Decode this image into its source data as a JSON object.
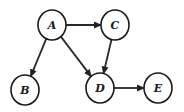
{
  "diagram": {
    "type": "directed-graph",
    "nodes": [
      {
        "id": "A",
        "label": "A",
        "cx": 52,
        "cy": 25,
        "rx": 14,
        "ry": 15
      },
      {
        "id": "C",
        "label": "C",
        "cx": 115,
        "cy": 25,
        "rx": 14,
        "ry": 15
      },
      {
        "id": "B",
        "label": "B",
        "cx": 25,
        "cy": 90,
        "rx": 14,
        "ry": 15
      },
      {
        "id": "D",
        "label": "D",
        "cx": 100,
        "cy": 88,
        "rx": 14,
        "ry": 15
      },
      {
        "id": "E",
        "label": "E",
        "cx": 158,
        "cy": 88,
        "rx": 14,
        "ry": 15
      }
    ],
    "edges": [
      {
        "from": "A",
        "to": "C"
      },
      {
        "from": "A",
        "to": "B"
      },
      {
        "from": "A",
        "to": "D"
      },
      {
        "from": "C",
        "to": "D"
      },
      {
        "from": "D",
        "to": "E"
      }
    ],
    "colors": {
      "stroke": "#1a1a1a",
      "fill": "#ffffff",
      "background": "#ffffff"
    }
  }
}
